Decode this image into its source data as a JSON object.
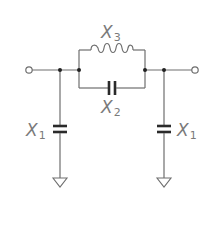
{
  "diagram": {
    "type": "circuit-schematic",
    "components": [
      {
        "id": "X1-left",
        "kind": "capacitor",
        "label": "X",
        "subscript": "1",
        "connection": "shunt-to-ground"
      },
      {
        "id": "X3",
        "kind": "inductor",
        "label": "X",
        "subscript": "3",
        "connection": "series-upper-branch"
      },
      {
        "id": "X2",
        "kind": "capacitor",
        "label": "X",
        "subscript": "2",
        "connection": "series-lower-branch"
      },
      {
        "id": "X1-right",
        "kind": "capacitor",
        "label": "X",
        "subscript": "1",
        "connection": "shunt-to-ground"
      }
    ],
    "terminals": [
      "input",
      "output"
    ],
    "grounds": 2,
    "colors": {
      "wire": "#6e6e6e",
      "plate": "#2a2a2a",
      "junction": "#222222",
      "label": "#7a7a7a"
    }
  }
}
